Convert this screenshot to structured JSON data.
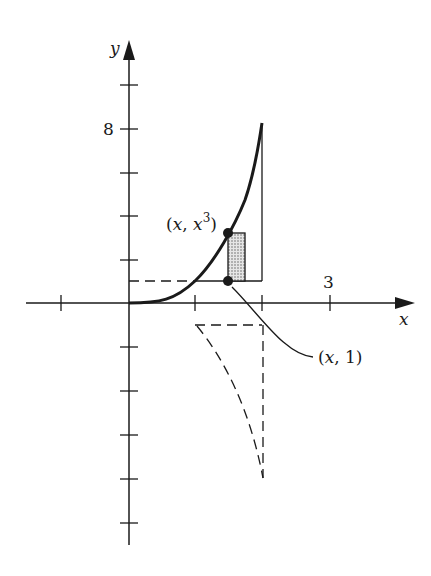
{
  "figure": {
    "axes": {
      "x_label": "x",
      "y_label": "y",
      "x_tick_label": "3",
      "y_tick_label": "8",
      "x_ticks": [
        -1,
        0,
        1,
        2,
        3
      ],
      "y_ticks": [
        10,
        8,
        6,
        4,
        2,
        -2,
        -4,
        -6,
        -8,
        -10
      ]
    },
    "curve": {
      "equation": "y = x^3",
      "domain": [
        0,
        2
      ]
    },
    "boundary_line": {
      "equation": "y = 1",
      "style": "dashed"
    },
    "points": [
      {
        "label_main": "(x, x",
        "label_sup": "3",
        "label_close": ")"
      },
      {
        "label": "(x, 1)"
      }
    ],
    "colors": {
      "ink": "#1a1a1a",
      "strip_fill": "#bdbdbd",
      "background": "#ffffff"
    }
  }
}
